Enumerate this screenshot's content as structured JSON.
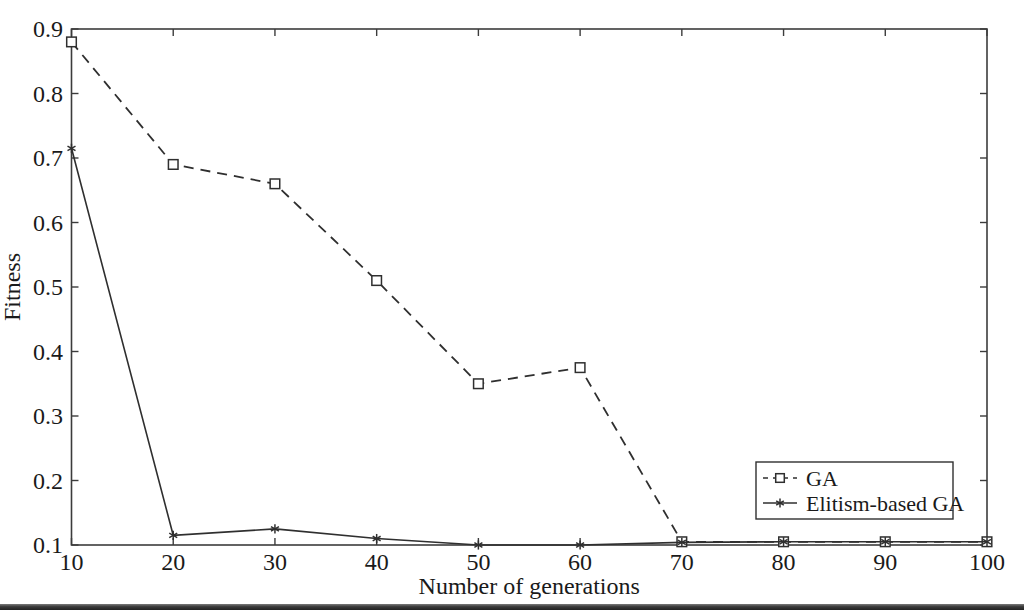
{
  "figure": {
    "background": "#ffffff",
    "page_edge_color": "#3a3a3a"
  },
  "colors": {
    "axis": "#3c3c3c",
    "line": "#2f2f2f",
    "text": "#1a1a1a",
    "marker_fill": "#ffffff",
    "legend_border": "#2f2f2f"
  },
  "chart_data": {
    "type": "line",
    "title": "",
    "xlabel": "Number of generations",
    "ylabel": "Fitness",
    "xlim": [
      10,
      100
    ],
    "ylim": [
      0.1,
      0.9
    ],
    "xticks": [
      10,
      20,
      30,
      40,
      50,
      60,
      70,
      80,
      90,
      100
    ],
    "yticks": [
      0.1,
      0.2,
      0.3,
      0.4,
      0.5,
      0.6,
      0.7,
      0.8,
      0.9
    ],
    "grid": false,
    "x": [
      10,
      20,
      30,
      40,
      50,
      60,
      70,
      80,
      90,
      100
    ],
    "series": [
      {
        "name": "GA",
        "line_style": "dashed",
        "marker": "square",
        "color": "#2f2f2f",
        "values": [
          0.88,
          0.69,
          0.66,
          0.51,
          0.35,
          0.375,
          0.105,
          0.105,
          0.105,
          0.105
        ]
      },
      {
        "name": "Elitism-based GA",
        "line_style": "solid",
        "marker": "asterisk",
        "color": "#2f2f2f",
        "values": [
          0.715,
          0.115,
          0.125,
          0.11,
          0.1,
          0.1,
          0.104,
          0.105,
          0.105,
          0.105
        ]
      }
    ],
    "legend": {
      "position": "southeast",
      "entries": [
        "GA",
        "Elitism-based GA"
      ]
    }
  }
}
